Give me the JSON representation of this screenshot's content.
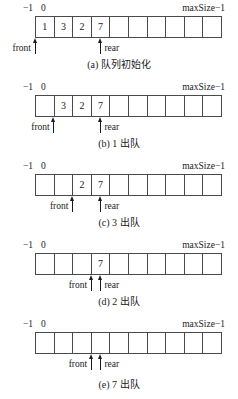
{
  "figure": {
    "cell_count": 10,
    "labels": {
      "index_neg_one": "−1",
      "index_zero": "0",
      "index_max": "maxSize−1",
      "front": "front",
      "rear": "rear"
    }
  },
  "panels": [
    {
      "id": "a",
      "caption": "(a) 队列初始化",
      "cells": [
        "1",
        "3",
        "2",
        "7",
        "",
        "",
        "",
        "",
        "",
        ""
      ],
      "front": {
        "label": "front",
        "cell_index": 0,
        "edge": "left",
        "label_side": "left"
      },
      "rear": {
        "label": "rear",
        "cell_index": 3,
        "edge": "center",
        "label_side": "right"
      }
    },
    {
      "id": "b",
      "caption": "(b) 1 出队",
      "cells": [
        "",
        "3",
        "2",
        "7",
        "",
        "",
        "",
        "",
        "",
        ""
      ],
      "front": {
        "label": "front",
        "cell_index": 1,
        "edge": "left",
        "label_side": "left"
      },
      "rear": {
        "label": "rear",
        "cell_index": 3,
        "edge": "center",
        "label_side": "right"
      }
    },
    {
      "id": "c",
      "caption": "(c) 3 出队",
      "cells": [
        "",
        "",
        "2",
        "7",
        "",
        "",
        "",
        "",
        "",
        ""
      ],
      "front": {
        "label": "front",
        "cell_index": 2,
        "edge": "left",
        "label_side": "left"
      },
      "rear": {
        "label": "rear",
        "cell_index": 3,
        "edge": "center",
        "label_side": "right"
      }
    },
    {
      "id": "d",
      "caption": "(d) 2 出队",
      "cells": [
        "",
        "",
        "",
        "7",
        "",
        "",
        "",
        "",
        "",
        ""
      ],
      "front": {
        "label": "front",
        "cell_index": 3,
        "edge": "left",
        "label_side": "left"
      },
      "rear": {
        "label": "rear",
        "cell_index": 3,
        "edge": "center",
        "label_side": "right"
      }
    },
    {
      "id": "e",
      "caption": "(e) 7 出队",
      "cells": [
        "",
        "",
        "",
        "",
        "",
        "",
        "",
        "",
        "",
        ""
      ],
      "front": {
        "label": "front",
        "cell_index": 3,
        "edge": "left",
        "label_side": "left"
      },
      "rear": {
        "label": "rear",
        "cell_index": 3,
        "edge": "center",
        "label_side": "right"
      }
    }
  ]
}
